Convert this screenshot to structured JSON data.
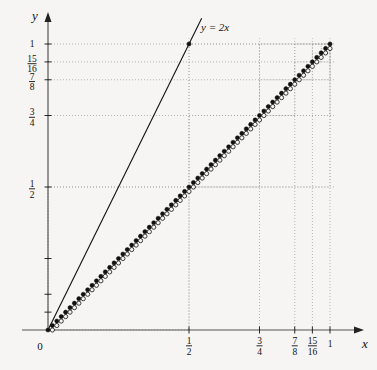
{
  "figure": {
    "title": "",
    "background_color": "#f6f5f3",
    "ink_color": "#111111",
    "grid_color": "#9a9a9a"
  },
  "axes": {
    "x_axis_label": "x",
    "y_axis_label": "y",
    "origin_label": "0",
    "x_range": [
      0,
      1
    ],
    "y_range": [
      0,
      1
    ],
    "x_ticks": [
      {
        "value": 0.5,
        "num": "1",
        "den": "2"
      },
      {
        "value": 0.75,
        "num": "3",
        "den": "4"
      },
      {
        "value": 0.875,
        "num": "7",
        "den": "8"
      },
      {
        "value": 0.9375,
        "num": "15",
        "den": "16"
      },
      {
        "value": 1,
        "num": "1",
        "den": ""
      }
    ],
    "y_ticks": [
      {
        "value": 1,
        "num": "1",
        "den": ""
      },
      {
        "value": 0.9375,
        "num": "15",
        "den": "16"
      },
      {
        "value": 0.875,
        "num": "7",
        "den": "8"
      },
      {
        "value": 0.75,
        "num": "3",
        "den": "4"
      },
      {
        "value": 0.5,
        "num": "1",
        "den": "2"
      },
      {
        "value": 0.25,
        "num": "",
        "den": ""
      },
      {
        "value": 0.125,
        "num": "",
        "den": ""
      },
      {
        "value": 0.0625,
        "num": "",
        "den": ""
      }
    ]
  },
  "reference_line": {
    "label": "y = 2x",
    "slope": 2,
    "intercept": 0,
    "label_x": 0.52,
    "label_y": 1.05
  },
  "chart_data": {
    "type": "line",
    "title": "",
    "xlabel": "x",
    "ylabel": "y",
    "xlim": [
      0,
      1
    ],
    "ylim": [
      0,
      1
    ],
    "grid": true,
    "legend": [
      "y = 2x"
    ],
    "recursion_depth": 4,
    "dotted_guides_x": [
      0.5,
      0.75,
      0.875,
      0.9375,
      1
    ],
    "dotted_guides_y": [
      0.5,
      0.75,
      0.875,
      0.9375,
      1
    ],
    "series": [
      {
        "name": "staircase",
        "point_style": {
          "closed": "filled-dot",
          "open": "hollow-circle"
        }
      },
      {
        "name": "y = 2x",
        "x": [
          0,
          0.5
        ],
        "values": [
          0,
          1
        ]
      }
    ]
  }
}
